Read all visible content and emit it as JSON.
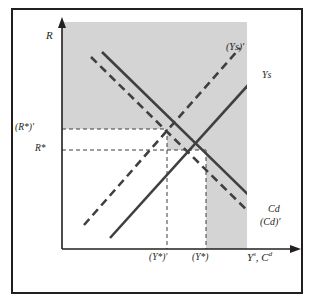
{
  "figure": {
    "type": "economics-diagram",
    "background_color": "#ffffff",
    "shade_color": "#d4d4d4",
    "line_color": "#3f3f3f",
    "frame_color": "#231f20"
  },
  "axes": {
    "y_label": "R",
    "x_label_parts": [
      "Y",
      "s",
      ", ",
      "C",
      "d"
    ],
    "x_label_plain": "Ys, Cd",
    "y_arrow": "up-arrow",
    "x_arrow": "right-arrow",
    "origin": {
      "x": 62,
      "y": 249
    }
  },
  "ticks": {
    "y": [
      {
        "id": "r-star-prime",
        "label_plain": "(R*)'",
        "value_px": 129
      },
      {
        "id": "r-star",
        "label_plain": "R*",
        "value_px": 150
      }
    ],
    "x": [
      {
        "id": "y-star-prime",
        "label_plain": "(Y*)'",
        "value_px": 167
      },
      {
        "id": "y-star",
        "label_plain": "(Y*)",
        "value_px": 206
      }
    ]
  },
  "curves": [
    {
      "id": "ys-shifted",
      "label_plain": "(Ys)'",
      "style": "dashed",
      "slope": "upward",
      "label_pos": {
        "x": 226,
        "y": 42
      }
    },
    {
      "id": "ys",
      "label_plain": "Ys",
      "style": "solid",
      "slope": "upward",
      "label_pos": {
        "x": 262,
        "y": 70
      }
    },
    {
      "id": "cd",
      "label_plain": "Cd",
      "style": "solid",
      "slope": "downward",
      "label_pos": {
        "x": 268,
        "y": 206
      }
    },
    {
      "id": "cd-shifted",
      "label_plain": "(Cd)'",
      "style": "dashed",
      "slope": "downward",
      "label_pos": {
        "x": 262,
        "y": 219
      }
    }
  ],
  "equilibria": [
    {
      "id": "new-equilibrium",
      "x_px": 167,
      "y_px": 129,
      "x_label": "(Y*)'",
      "y_label": "(R*)'"
    },
    {
      "id": "original-equilibrium",
      "x_px": 206,
      "y_px": 150,
      "x_label": "(Y*)",
      "y_label": "R*"
    }
  ]
}
